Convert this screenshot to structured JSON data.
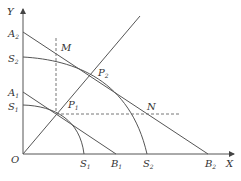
{
  "diagram": {
    "axes": {
      "x_label": "X",
      "y_label": "Y",
      "origin_label": "O"
    },
    "y_axis_labels": [
      {
        "main": "A",
        "sub": "2"
      },
      {
        "main": "S",
        "sub": "2"
      },
      {
        "main": "A",
        "sub": "1"
      },
      {
        "main": "S",
        "sub": "1"
      }
    ],
    "x_axis_labels": [
      {
        "main": "S",
        "sub": "1"
      },
      {
        "main": "B",
        "sub": "1"
      },
      {
        "main": "S",
        "sub": "2"
      },
      {
        "main": "B",
        "sub": "2"
      }
    ],
    "points": [
      {
        "main": "P",
        "sub": "1"
      },
      {
        "main": "P",
        "sub": "2"
      },
      {
        "main": "M",
        "sub": ""
      },
      {
        "main": "N",
        "sub": ""
      }
    ],
    "curves": [
      "budget-line-A1B1",
      "budget-line-A2B2",
      "production-frontier-S1S1",
      "production-frontier-S2S2",
      "expansion-ray-OP"
    ]
  }
}
